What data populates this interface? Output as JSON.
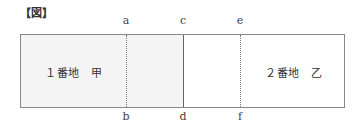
{
  "title": "【図】",
  "diagram": {
    "parcels": [
      {
        "id": "parcel-1",
        "label": "１番地　甲"
      },
      {
        "id": "parcel-2",
        "label": "２番地　乙"
      }
    ],
    "lines": [
      {
        "top": "a",
        "bottom": "b",
        "style": "dashed"
      },
      {
        "top": "c",
        "bottom": "d",
        "style": "solid"
      },
      {
        "top": "e",
        "bottom": "f",
        "style": "dashed"
      }
    ],
    "colors": {
      "border": "#888888",
      "shade": "#f4f4f4",
      "solid_line": "#666666"
    }
  }
}
